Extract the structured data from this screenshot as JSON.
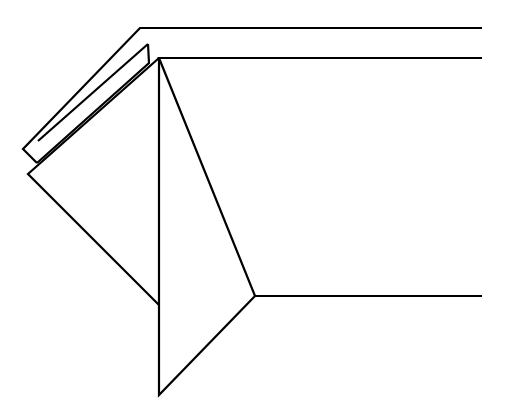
{
  "diagram": {
    "type": "line-drawing",
    "stroke_color": "#000000",
    "background": "#ffffff",
    "polylines": {
      "outer_band": "482,28 140,28 23,149 37,163",
      "inner_flap_a": "148,44 38,141",
      "inner_flap_b": "148,44 149,63 37,163",
      "top_panel": "482,58 159,58 255,296 482,296",
      "front_triangle": "159,58 159,395 255,296",
      "left_flap": "159,58 28,174 159,305"
    }
  }
}
